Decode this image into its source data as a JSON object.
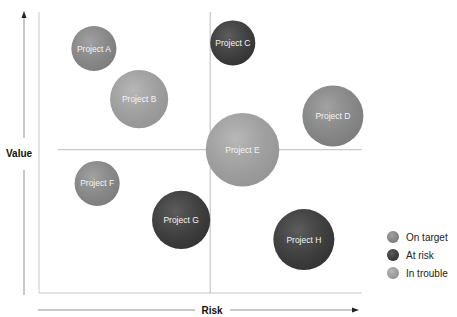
{
  "chart_data": {
    "type": "scatter",
    "subtype": "bubble",
    "title": "",
    "xlabel": "Risk",
    "ylabel": "Value",
    "xlim": [
      0,
      10
    ],
    "ylim": [
      0,
      10
    ],
    "quadrant_dividers": {
      "x": 5.3,
      "y": 5.1
    },
    "grid": false,
    "legend_position": "bottom-right",
    "statuses": [
      {
        "key": "on_target",
        "label": "On target",
        "color": "#8e8e8e"
      },
      {
        "key": "at_risk",
        "label": "At risk",
        "color": "#3a3a3a"
      },
      {
        "key": "in_trouble",
        "label": "In trouble",
        "color": "#a9a9a9"
      }
    ],
    "points": [
      {
        "name": "Project A",
        "risk": 1.7,
        "value": 8.7,
        "size": 3,
        "status": "on_target"
      },
      {
        "name": "Project B",
        "risk": 3.1,
        "value": 6.9,
        "size": 5,
        "status": "in_trouble"
      },
      {
        "name": "Project C",
        "risk": 6.0,
        "value": 8.9,
        "size": 3,
        "status": "at_risk"
      },
      {
        "name": "Project D",
        "risk": 9.1,
        "value": 6.3,
        "size": 5.5,
        "status": "on_target"
      },
      {
        "name": "Project E",
        "risk": 6.3,
        "value": 5.1,
        "size": 8,
        "status": "in_trouble"
      },
      {
        "name": "Project F",
        "risk": 1.8,
        "value": 3.9,
        "size": 3,
        "status": "on_target"
      },
      {
        "name": "Project G",
        "risk": 4.4,
        "value": 2.6,
        "size": 5,
        "status": "at_risk"
      },
      {
        "name": "Project H",
        "risk": 8.2,
        "value": 1.9,
        "size": 5.5,
        "status": "at_risk"
      }
    ]
  }
}
